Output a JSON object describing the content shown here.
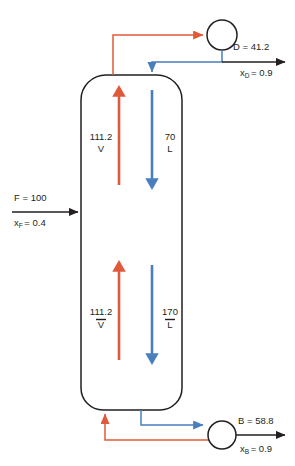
{
  "diagram": {
    "type": "process-flow-diagram",
    "colors": {
      "vapor": "#e1593b",
      "liquid": "#4a7fbd",
      "line": "#231f20",
      "background": "#ffffff"
    },
    "feed": {
      "flow_label": "F = 100",
      "composition_symbol": "x",
      "composition_subscript": "F",
      "composition_label": "= 0.4",
      "composition_full": "x_F = 0.4"
    },
    "distillate": {
      "flow_label": "D = 41.2",
      "composition_symbol": "x",
      "composition_subscript": "D",
      "composition_label": "= 0.9",
      "composition_full": "x_D = 0.9"
    },
    "bottoms": {
      "flow_label": "B = 58.8",
      "composition_symbol": "x",
      "composition_subscript": "B",
      "composition_label": "= 0.9",
      "composition_full": "x_B = 0.9"
    },
    "rectifying_section": {
      "vapor_value": "111.2",
      "vapor_symbol": "V",
      "liquid_value": "70",
      "liquid_symbol": "L"
    },
    "stripping_section": {
      "vapor_value": "111.2",
      "vapor_symbol": "V",
      "vapor_overbar": true,
      "liquid_value": "170",
      "liquid_symbol": "L",
      "liquid_overbar": true
    },
    "equipment": {
      "condenser_name": "condenser",
      "reboiler_name": "reboiler",
      "column_name": "distillation-column"
    }
  }
}
